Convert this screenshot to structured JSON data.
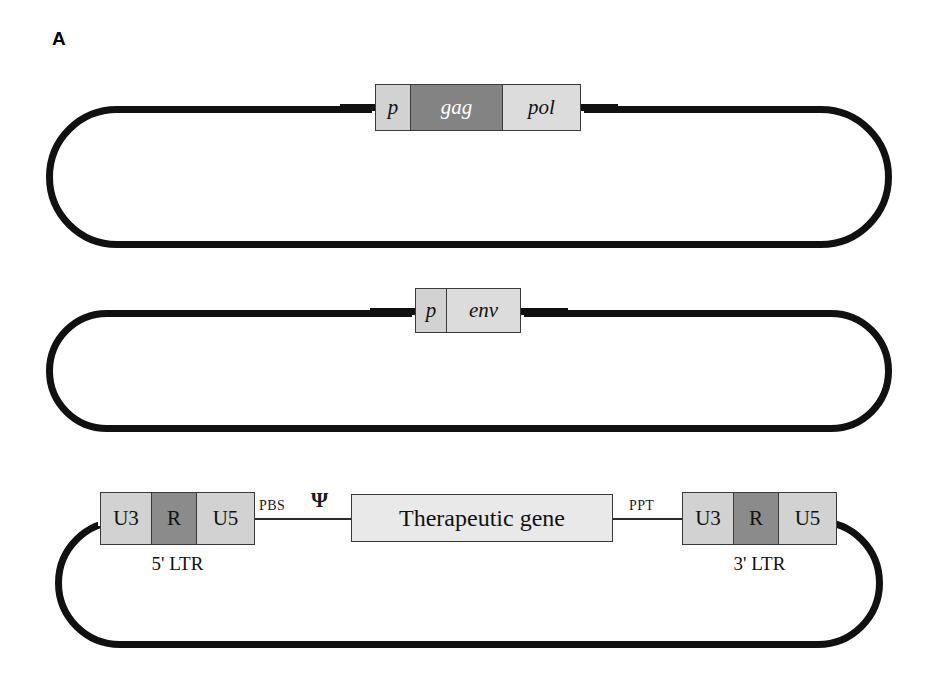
{
  "figure": {
    "panel_letter": "A"
  },
  "constructs": [
    {
      "id": "gagpol-packaging-plasmid",
      "segments": [
        {
          "label": "p",
          "shade": "light",
          "style": "italic"
        },
        {
          "label": "gag",
          "shade": "dark",
          "style": "italic"
        },
        {
          "label": "pol",
          "shade": "light",
          "style": "italic"
        }
      ]
    },
    {
      "id": "env-plasmid",
      "segments": [
        {
          "label": "p",
          "shade": "light",
          "style": "italic"
        },
        {
          "label": "env",
          "shade": "light",
          "style": "italic"
        }
      ]
    },
    {
      "id": "transfer-vector-plasmid",
      "five_prime_ltr": {
        "segments": [
          {
            "label": "U3",
            "shade": "light"
          },
          {
            "label": "R",
            "shade": "dark"
          },
          {
            "label": "U5",
            "shade": "light"
          }
        ],
        "caption": "5' LTR"
      },
      "three_prime_ltr": {
        "segments": [
          {
            "label": "U3",
            "shade": "light"
          },
          {
            "label": "R",
            "shade": "dark"
          },
          {
            "label": "U5",
            "shade": "light"
          }
        ],
        "caption": "3' LTR"
      },
      "gene_box": {
        "label": "Therapeutic gene",
        "shade": "pale"
      },
      "annotations": {
        "pbs": "PBS",
        "psi": "Ψ",
        "ppt": "PPT"
      }
    }
  ],
  "colors": {
    "outline": "#111111",
    "light_gray": "#d2d2d2",
    "pale_gray": "#e9e9e9",
    "dark_gray": "#838383",
    "text": "#111111"
  }
}
